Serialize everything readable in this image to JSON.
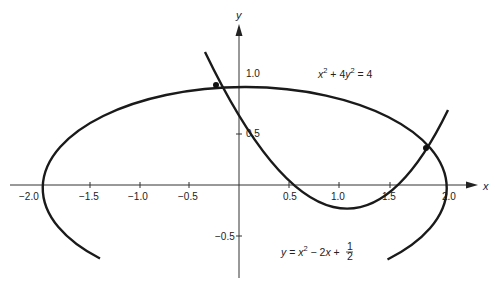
{
  "diagram": {
    "axes": {
      "x_label": "x",
      "y_label": "y",
      "x_ticks": [
        "−2.0",
        "−1.5",
        "−1.0",
        "−0.5",
        "0.5",
        "1.0",
        "1.5",
        "2.0"
      ],
      "y_ticks": [
        "1.0",
        "0.5",
        "−0.5"
      ]
    },
    "curves": [
      {
        "name": "ellipse",
        "equation": "x² + 4y² = 4",
        "label_parts": [
          "x",
          "2",
          " + 4",
          "y",
          "2",
          " = 4"
        ]
      },
      {
        "name": "parabola",
        "equation": "y = x² − 2x + 1/2",
        "label_parts": [
          "y",
          " = ",
          "x",
          "2",
          " − 2",
          "x",
          " + ",
          "1",
          "2"
        ]
      }
    ],
    "intersections": [
      {
        "x": -0.22,
        "y": 0.99
      },
      {
        "x": 1.86,
        "y": 0.37
      }
    ],
    "colors": {
      "stroke": "#1a1a1a",
      "axis": "#333333",
      "background": "#ffffff"
    }
  }
}
